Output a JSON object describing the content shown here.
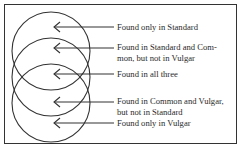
{
  "diagram": {
    "type": "overlapping-circles-legend",
    "circles": [
      {
        "name": "Standard",
        "cx": 51,
        "cy": 51,
        "r": 39
      },
      {
        "name": "Common",
        "cx": 51,
        "cy": 77,
        "r": 39
      },
      {
        "name": "Vulgar",
        "cx": 51,
        "cy": 103,
        "r": 39
      }
    ],
    "annotations": [
      {
        "y": 27,
        "lines": [
          "Found only in Standard"
        ]
      },
      {
        "y": 48,
        "lines": [
          "Found in Standard and Com-",
          "mon, but not in Vulgar"
        ]
      },
      {
        "y": 74,
        "lines": [
          "Found in all three"
        ]
      },
      {
        "y": 102,
        "lines": [
          "Found in Common and Vulgar,",
          "but not in Standard"
        ]
      },
      {
        "y": 123,
        "lines": [
          "Found only in Vulgar"
        ]
      }
    ],
    "colors": {
      "stroke": "#333333",
      "text": "#2a2a2a",
      "background": "#ffffff"
    }
  }
}
